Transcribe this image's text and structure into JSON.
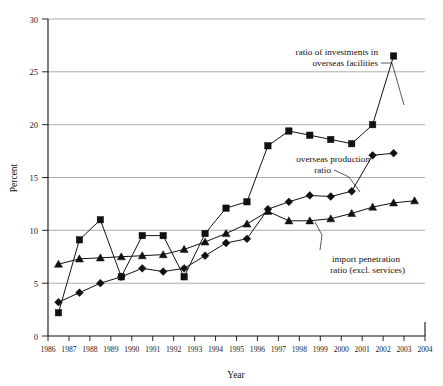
{
  "chart_data": {
    "type": "line",
    "title": "",
    "xlabel": "Year",
    "ylabel": "Percent",
    "xlim": [
      1986,
      2004
    ],
    "ylim": [
      0,
      30
    ],
    "yticks": [
      0,
      5,
      10,
      15,
      20,
      25,
      30
    ],
    "xticks": [
      1986,
      1987,
      1988,
      1989,
      1990,
      1991,
      1992,
      1993,
      1994,
      1995,
      1996,
      1997,
      1998,
      1999,
      2000,
      2001,
      2002,
      2003,
      2004
    ],
    "grid": "horizontal",
    "legend_position": "inline-annotations",
    "x": [
      1986,
      1987,
      1988,
      1989,
      1990,
      1991,
      1992,
      1993,
      1994,
      1995,
      1996,
      1997,
      1998,
      1999,
      2000,
      2001,
      2002,
      2003
    ],
    "series": [
      {
        "name": "ratio of investments in overseas facilities",
        "marker": "square",
        "x": [
          1986,
          1987,
          1988,
          1989,
          1990,
          1991,
          1992,
          1993,
          1994,
          1995,
          1996,
          1997,
          1998,
          1999,
          2000,
          2001,
          2002
        ],
        "values": [
          2.2,
          9.1,
          11.0,
          5.6,
          9.5,
          9.5,
          5.6,
          9.7,
          12.1,
          12.7,
          18.0,
          19.4,
          19.0,
          18.6,
          18.2,
          20.0,
          26.5
        ]
      },
      {
        "name": "overseas production ratio",
        "marker": "diamond",
        "x": [
          1986,
          1987,
          1988,
          1989,
          1990,
          1991,
          1992,
          1993,
          1994,
          1995,
          1996,
          1997,
          1998,
          1999,
          2000,
          2001,
          2002
        ],
        "values": [
          3.2,
          4.1,
          5.0,
          5.6,
          6.4,
          6.1,
          6.4,
          7.6,
          8.8,
          9.2,
          12.0,
          12.7,
          13.3,
          13.2,
          13.7,
          17.1,
          17.3
        ]
      },
      {
        "name": "import penetration ratio (excl. services)",
        "marker": "triangle",
        "x": [
          1986,
          1987,
          1988,
          1989,
          1990,
          1991,
          1992,
          1993,
          1994,
          1995,
          1996,
          1997,
          1998,
          1999,
          2000,
          2001,
          2002,
          2003
        ],
        "values": [
          6.8,
          7.3,
          7.4,
          7.5,
          7.6,
          7.7,
          8.2,
          8.9,
          9.7,
          10.6,
          11.8,
          10.9,
          10.9,
          11.1,
          11.6,
          12.2,
          12.6,
          12.8
        ]
      }
    ],
    "annotations": [
      {
        "id": "annot-investments",
        "line1": "ratio of investments in",
        "line2": "overseas facilities"
      },
      {
        "id": "annot-production",
        "line1": "overseas production",
        "line2": "ratio"
      },
      {
        "id": "annot-import",
        "line1": "import penetration",
        "line2": "ratio (excl. services)"
      }
    ],
    "colors": {
      "ink": "#111111",
      "grid": "#8a8a8a",
      "background": "#ffffff"
    }
  }
}
